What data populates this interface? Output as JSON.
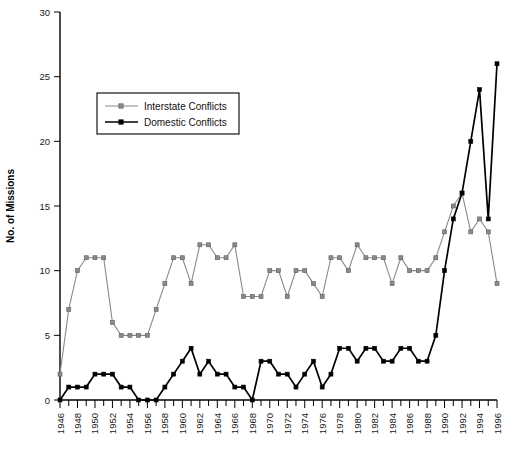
{
  "chart_data": {
    "type": "line",
    "title": "",
    "xlabel": "",
    "ylabel": "No. of Missions",
    "ylim": [
      0,
      30
    ],
    "xlim": [
      1946,
      1996
    ],
    "grid": false,
    "legend_position": "upper-left-inside",
    "y_ticks": [
      0,
      5,
      10,
      15,
      20,
      25,
      30
    ],
    "x_ticks": [
      1946,
      1948,
      1950,
      1952,
      1954,
      1956,
      1958,
      1960,
      1962,
      1964,
      1966,
      1968,
      1970,
      1972,
      1974,
      1976,
      1978,
      1980,
      1982,
      1984,
      1986,
      1988,
      1990,
      1992,
      1994,
      1996
    ],
    "x": [
      1946,
      1947,
      1948,
      1949,
      1950,
      1951,
      1952,
      1953,
      1954,
      1955,
      1956,
      1957,
      1958,
      1959,
      1960,
      1961,
      1962,
      1963,
      1964,
      1965,
      1966,
      1967,
      1968,
      1969,
      1970,
      1971,
      1972,
      1973,
      1974,
      1975,
      1976,
      1977,
      1978,
      1979,
      1980,
      1981,
      1982,
      1983,
      1984,
      1985,
      1986,
      1987,
      1988,
      1989,
      1990,
      1991,
      1992,
      1993,
      1994,
      1995,
      1996
    ],
    "series": [
      {
        "name": "Interstate Conflicts",
        "color": "#8a8a8a",
        "values": [
          2,
          7,
          10,
          11,
          11,
          11,
          6,
          5,
          5,
          5,
          5,
          7,
          9,
          11,
          11,
          9,
          12,
          12,
          11,
          11,
          12,
          8,
          8,
          8,
          10,
          10,
          8,
          10,
          10,
          9,
          8,
          11,
          11,
          10,
          12,
          11,
          11,
          11,
          9,
          11,
          10,
          10,
          10,
          11,
          13,
          15,
          16,
          13,
          14,
          13,
          9
        ]
      },
      {
        "name": "Domestic Conflicts",
        "color": "#000000",
        "values": [
          0,
          1,
          1,
          1,
          2,
          2,
          2,
          1,
          1,
          0,
          0,
          0,
          1,
          2,
          3,
          4,
          2,
          3,
          2,
          2,
          1,
          1,
          0,
          3,
          3,
          2,
          2,
          1,
          2,
          3,
          1,
          2,
          4,
          4,
          3,
          4,
          4,
          3,
          3,
          4,
          4,
          3,
          3,
          5,
          10,
          14,
          16,
          20,
          24,
          14,
          26
        ]
      }
    ]
  },
  "legend": {
    "entries": [
      {
        "label": "Interstate Conflicts",
        "marker": "square-gray"
      },
      {
        "label": "Domestic Conflicts",
        "marker": "square-black"
      }
    ]
  },
  "axes": {
    "y_axis_label": "No. of Missions"
  }
}
